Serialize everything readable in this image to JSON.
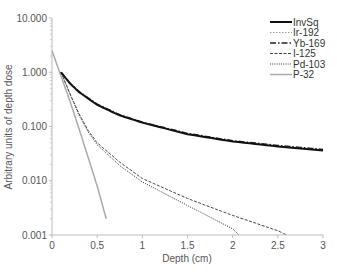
{
  "chart_data": {
    "type": "line",
    "title": "",
    "xlabel": "Depth (cm)",
    "ylabel": "Arbitrary units of depth dose",
    "xlim": [
      0,
      3
    ],
    "ylim": [
      0.001,
      10
    ],
    "yscale": "log",
    "grid": false,
    "legend_position": "upper right",
    "x_ticks": [
      "0",
      "0.5",
      "1",
      "1.5",
      "2",
      "2.5",
      "3"
    ],
    "y_ticks": [
      "10.000",
      "1.000",
      "0.100",
      "0.010",
      "0.001"
    ],
    "series": [
      {
        "name": "InvSq",
        "style": "solid",
        "color": "#111111",
        "width": 2,
        "x": [
          0.1,
          0.2,
          0.3,
          0.5,
          0.75,
          1.0,
          1.5,
          2.0,
          2.5,
          3.0
        ],
        "y": [
          1.0,
          0.62,
          0.43,
          0.25,
          0.16,
          0.118,
          0.072,
          0.053,
          0.043,
          0.036
        ]
      },
      {
        "name": "Ir-192",
        "style": "dotted-light",
        "color": "#999999",
        "width": 1,
        "x": [
          0.1,
          0.2,
          0.3,
          0.5,
          0.75,
          1.0,
          1.5,
          2.0,
          2.5,
          3.0
        ],
        "y": [
          1.0,
          0.62,
          0.43,
          0.25,
          0.16,
          0.118,
          0.072,
          0.053,
          0.043,
          0.037
        ]
      },
      {
        "name": "Yb-169",
        "style": "dash-dot",
        "color": "#222222",
        "width": 1.3,
        "x": [
          0.1,
          0.2,
          0.3,
          0.5,
          0.75,
          1.0,
          1.5,
          2.0,
          2.5,
          3.0
        ],
        "y": [
          1.0,
          0.63,
          0.44,
          0.26,
          0.165,
          0.121,
          0.075,
          0.055,
          0.045,
          0.038
        ]
      },
      {
        "name": "I-125",
        "style": "dashed",
        "color": "#444444",
        "width": 1,
        "x": [
          0.1,
          0.2,
          0.3,
          0.4,
          0.5,
          0.75,
          1.0,
          1.5,
          2.0,
          2.5,
          2.6
        ],
        "y": [
          1.0,
          0.4,
          0.17,
          0.085,
          0.05,
          0.022,
          0.011,
          0.0047,
          0.0023,
          0.0012,
          0.001
        ]
      },
      {
        "name": "Pd-103",
        "style": "dotted",
        "color": "#333333",
        "width": 1,
        "x": [
          0.1,
          0.2,
          0.3,
          0.4,
          0.5,
          0.75,
          1.0,
          1.5,
          2.0,
          2.07
        ],
        "y": [
          1.0,
          0.39,
          0.16,
          0.08,
          0.046,
          0.019,
          0.0095,
          0.0035,
          0.0013,
          0.001
        ]
      },
      {
        "name": "P-32",
        "style": "solid-grey",
        "color": "#aaaaaa",
        "width": 1.5,
        "x": [
          0.0,
          0.1,
          0.2,
          0.3,
          0.4,
          0.5,
          0.6
        ],
        "y": [
          2.5,
          0.85,
          0.29,
          0.09,
          0.027,
          0.008,
          0.002
        ]
      }
    ]
  }
}
